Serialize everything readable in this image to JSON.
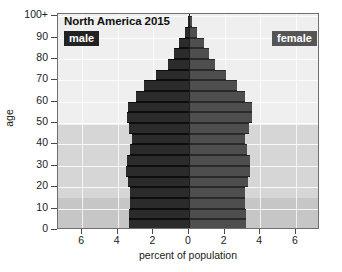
{
  "chart_data": {
    "type": "bar",
    "subtype": "population-pyramid",
    "title": "North America 2015",
    "xlabel": "percent of population",
    "ylabel": "age",
    "xlim": [
      -7.35,
      7.35
    ],
    "ylim": [
      0,
      101
    ],
    "grid": true,
    "legend_position": "inside-top-corners",
    "xtick_values": [
      -6,
      -4,
      -2,
      0,
      2,
      4,
      6
    ],
    "xtick_labels": [
      "6",
      "4",
      "2",
      "0",
      "2",
      "4",
      "6"
    ],
    "ytick_values": [
      0,
      10,
      20,
      30,
      40,
      50,
      60,
      70,
      80,
      90,
      100
    ],
    "ytick_labels": [
      "0",
      "10",
      "20",
      "30",
      "40",
      "50",
      "60",
      "70",
      "80",
      "90",
      "100+"
    ],
    "age_groups": [
      "0-4",
      "5-9",
      "10-14",
      "15-19",
      "20-24",
      "25-29",
      "30-34",
      "35-39",
      "40-44",
      "45-49",
      "50-54",
      "55-59",
      "60-64",
      "65-69",
      "70-74",
      "75-79",
      "80-84",
      "85-89",
      "90-94",
      "95-99",
      "100+"
    ],
    "series": [
      {
        "name": "male",
        "color": "#2b2b2b",
        "side": "left",
        "values": [
          3.35,
          3.35,
          3.3,
          3.3,
          3.45,
          3.55,
          3.5,
          3.3,
          3.2,
          3.35,
          3.5,
          3.45,
          3.0,
          2.5,
          1.85,
          1.2,
          0.85,
          0.55,
          0.25,
          0.07,
          0.02
        ]
      },
      {
        "name": "female",
        "color": "#4e4e4e",
        "side": "right",
        "values": [
          3.2,
          3.2,
          3.15,
          3.15,
          3.3,
          3.4,
          3.4,
          3.25,
          3.15,
          3.35,
          3.55,
          3.55,
          3.15,
          2.7,
          2.1,
          1.45,
          1.15,
          0.85,
          0.45,
          0.15,
          0.04
        ]
      }
    ],
    "background_bands": [
      {
        "name": "youth",
        "age_from": 0,
        "age_to": 15,
        "color": "#c6c6c6"
      },
      {
        "name": "working-age",
        "age_from": 15,
        "age_to": 49,
        "color": "#d6d6d6"
      },
      {
        "name": "older",
        "age_from": 49,
        "age_to": 101,
        "color": "#efefef"
      }
    ]
  },
  "labels": {
    "title": "North America 2015",
    "male_tag": "male",
    "female_tag": "female",
    "xaxis_title": "percent of population",
    "yaxis_title": "age"
  }
}
